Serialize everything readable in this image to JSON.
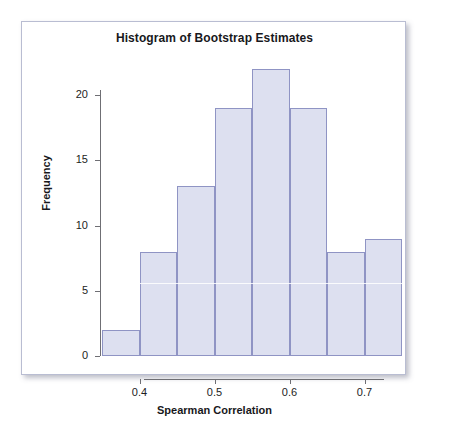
{
  "chart_data": {
    "type": "bar",
    "title": "Histogram of Bootstrap Estimates",
    "xlabel": "Spearman Correlation",
    "ylabel": "Frequency",
    "categories": [
      "0.35-0.40",
      "0.40-0.45",
      "0.45-0.50",
      "0.50-0.55",
      "0.55-0.60",
      "0.60-0.65",
      "0.65-0.70",
      "0.70-0.75"
    ],
    "bin_edges": [
      0.35,
      0.4,
      0.45,
      0.5,
      0.55,
      0.6,
      0.65,
      0.7,
      0.75
    ],
    "values": [
      2,
      8,
      13,
      19,
      22,
      19,
      8,
      9
    ],
    "bin_width": 0.05,
    "xlim": [
      0.35,
      0.75
    ],
    "ylim": [
      0,
      22
    ],
    "x_ticks": [
      "0.4",
      "0.5",
      "0.6",
      "0.7"
    ],
    "x_tick_values": [
      0.4,
      0.5,
      0.6,
      0.7
    ],
    "y_ticks": [
      "0",
      "5",
      "10",
      "15",
      "20"
    ],
    "y_tick_values": [
      0,
      5,
      10,
      15,
      20
    ],
    "grid": false,
    "legend": false,
    "bar_fill_color": "#dde0f0",
    "bar_border_color": "#8f94c4",
    "axis_color": "#6f6f74",
    "text_color": "#18181c",
    "background_color": "#ffffff",
    "card_border_color": "#b9bdd2"
  }
}
